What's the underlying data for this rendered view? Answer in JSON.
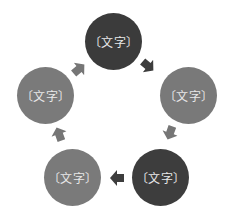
{
  "diagram": {
    "type": "cycle",
    "colors": {
      "dark": "#3b3b3b",
      "medium": "#797979",
      "arrow_dark": "#3d3d3d",
      "arrow_medium": "#767676"
    },
    "nodes": [
      {
        "id": "top",
        "label": "〔文字〕",
        "shade": "dark"
      },
      {
        "id": "right",
        "label": "〔文字〕",
        "shade": "medium"
      },
      {
        "id": "bottom-right",
        "label": "〔文字〕",
        "shade": "dark"
      },
      {
        "id": "bottom-left",
        "label": "〔文字〕",
        "shade": "medium"
      },
      {
        "id": "left",
        "label": "〔文字〕",
        "shade": "medium"
      }
    ],
    "edges": [
      {
        "from": "top",
        "to": "right"
      },
      {
        "from": "right",
        "to": "bottom-right"
      },
      {
        "from": "bottom-right",
        "to": "bottom-left"
      },
      {
        "from": "bottom-left",
        "to": "left"
      },
      {
        "from": "left",
        "to": "top"
      }
    ]
  }
}
